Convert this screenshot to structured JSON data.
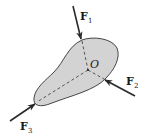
{
  "diagram": {
    "type": "free-body-diagram",
    "body": {
      "fill": "#d3d3d3",
      "stroke": "#333333"
    },
    "point": {
      "label": "O"
    },
    "forces": [
      {
        "id": "F1",
        "main": "F",
        "sub": "1"
      },
      {
        "id": "F2",
        "main": "F",
        "sub": "2"
      },
      {
        "id": "F3",
        "main": "F",
        "sub": "3"
      }
    ],
    "colors": {
      "arrow": "#2a2a2a",
      "dashed": "#333333",
      "body_fill": "#d3d3d3"
    }
  }
}
